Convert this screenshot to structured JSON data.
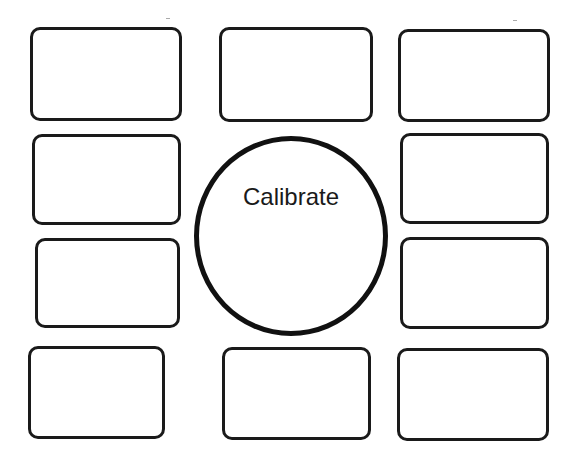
{
  "diagram": {
    "center": {
      "label": "Calibrate",
      "shape": "circle"
    },
    "boxes": [
      {
        "id": "top-left",
        "label": ""
      },
      {
        "id": "top-middle",
        "label": ""
      },
      {
        "id": "top-right",
        "label": ""
      },
      {
        "id": "left-2",
        "label": ""
      },
      {
        "id": "right-2",
        "label": ""
      },
      {
        "id": "left-3",
        "label": ""
      },
      {
        "id": "right-3",
        "label": ""
      },
      {
        "id": "bottom-left",
        "label": ""
      },
      {
        "id": "bottom-middle",
        "label": ""
      },
      {
        "id": "bottom-right",
        "label": ""
      }
    ],
    "colors": {
      "stroke": "#1a1a1a",
      "background": "#ffffff"
    }
  }
}
